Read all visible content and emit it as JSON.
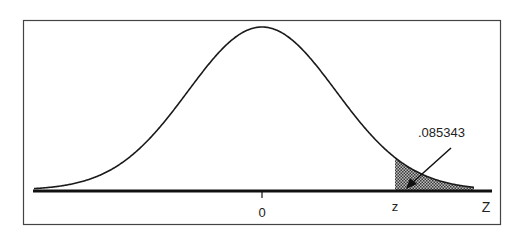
{
  "chart_data": {
    "type": "area",
    "title": "",
    "xlabel": "Z",
    "ylabel": "",
    "distribution": "standard normal",
    "x_ticks": [
      {
        "value": 0,
        "label": "0"
      }
    ],
    "markers": [
      {
        "label": "z",
        "position": "critical value"
      }
    ],
    "axis_label": "Z",
    "shaded_region": {
      "from": "z",
      "to": "+inf",
      "area": 0.085343
    },
    "annotations": [
      {
        "text": ".085343",
        "points_to": "shaded right tail"
      }
    ],
    "grid": false,
    "legend": null
  },
  "labels": {
    "zero": "0",
    "z_lower": "z",
    "z_upper": "Z",
    "area": ".085343"
  },
  "colors": {
    "ink": "#1a1a1a",
    "shade": "#6e6e6e",
    "frame": "#444444"
  }
}
